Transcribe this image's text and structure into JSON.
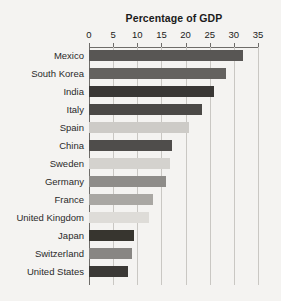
{
  "chart_data": {
    "type": "bar",
    "orientation": "horizontal",
    "title": "Percentage of GDP",
    "xlabel": "",
    "ylabel": "",
    "xlim": [
      0,
      35
    ],
    "xticks": [
      0,
      5,
      10,
      15,
      20,
      25,
      30,
      35
    ],
    "xtick_labels": [
      "0",
      "5",
      "10",
      "15",
      "20",
      "25",
      "30",
      "35"
    ],
    "grid": true,
    "legend": false,
    "categories": [
      "Mexico",
      "South Korea",
      "India",
      "Italy",
      "Spain",
      "China",
      "Sweden",
      "Germany",
      "France",
      "United Kingdom",
      "Japan",
      "Switzerland",
      "United States"
    ],
    "values": [
      31.9,
      28.4,
      25.9,
      23.3,
      20.7,
      17.1,
      16.8,
      16.0,
      13.2,
      12.5,
      9.4,
      8.9,
      8.1
    ],
    "bar_colors": [
      "#585654",
      "#64625f",
      "#393735",
      "#4a4846",
      "#cdcbc7",
      "#4f4d4b",
      "#d4d2ce",
      "#8e8c89",
      "#a9a7a3",
      "#dedcd8",
      "#37352f",
      "#888683",
      "#3b3936"
    ]
  },
  "style": {
    "background": "#f4f3f1",
    "axis_color": "#6e6c69",
    "gridline_color": "#c9c7c3",
    "text_color": "#1b1b1b",
    "label_color": "#2a2a2a"
  }
}
